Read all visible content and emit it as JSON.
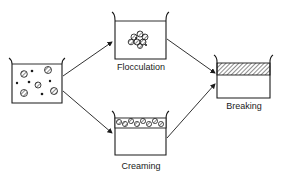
{
  "diagram": {
    "nodes": [
      {
        "id": "initial",
        "label": "",
        "description": "Dispersed emulsion droplets"
      },
      {
        "id": "flocculation",
        "label": "Flocculation"
      },
      {
        "id": "creaming",
        "label": "Creaming"
      },
      {
        "id": "breaking",
        "label": "Breaking"
      }
    ],
    "edges": [
      {
        "from": "initial",
        "to": "flocculation"
      },
      {
        "from": "initial",
        "to": "creaming"
      },
      {
        "from": "flocculation",
        "to": "breaking"
      },
      {
        "from": "creaming",
        "to": "breaking"
      }
    ],
    "colors": {
      "ink": "#1a1a1a",
      "background": "#ffffff"
    }
  }
}
